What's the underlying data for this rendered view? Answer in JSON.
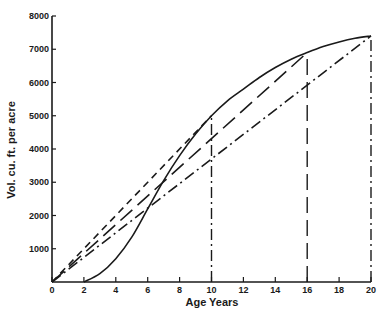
{
  "chart_data": {
    "type": "line",
    "title": "",
    "xlabel": "Age Years",
    "ylabel": "Vol. cu. ft. per acre",
    "xlim": [
      0,
      20
    ],
    "ylim": [
      0,
      8000
    ],
    "grid": false,
    "legend": null,
    "x_ticks": [
      0,
      2,
      4,
      6,
      8,
      10,
      12,
      14,
      16,
      18,
      20
    ],
    "y_ticks": [
      1000,
      2000,
      3000,
      4000,
      5000,
      6000,
      7000,
      8000
    ],
    "y_tick_labels": [
      "1000",
      "2000",
      "3000",
      "4000",
      "5000",
      "6000",
      "7000",
      "8000"
    ],
    "series": [
      {
        "name": "Total volume growth curve",
        "style": "solid",
        "x": [
          2,
          3,
          4,
          5,
          6,
          7,
          8,
          9,
          10,
          11,
          12,
          13,
          14,
          15,
          16,
          17,
          18,
          19,
          20
        ],
        "values": [
          0,
          250,
          700,
          1350,
          2200,
          3050,
          3800,
          4450,
          5000,
          5450,
          5800,
          6150,
          6450,
          6700,
          6900,
          7080,
          7220,
          7330,
          7400
        ]
      },
      {
        "name": "Mean annual increment line to 10 years",
        "style": "short-dash",
        "x": [
          0,
          10
        ],
        "values": [
          0,
          5000
        ]
      },
      {
        "name": "Mean annual increment line to 16 years",
        "style": "long-dash",
        "x": [
          0,
          16
        ],
        "values": [
          0,
          6900
        ]
      },
      {
        "name": "Mean annual increment line to 20 years",
        "style": "dash-dot",
        "x": [
          0,
          20
        ],
        "values": [
          0,
          7400
        ]
      }
    ],
    "reference_lines": [
      {
        "x": 10,
        "from": 0,
        "to": 5000,
        "style": "dash-dot"
      },
      {
        "x": 16,
        "from": 0,
        "to": 6900,
        "style": "long-dash"
      },
      {
        "x": 20,
        "from": 0,
        "to": 7400,
        "style": "dash-dot"
      }
    ]
  },
  "colors": {
    "ink": "#1a1a1a",
    "background": "#ffffff"
  }
}
